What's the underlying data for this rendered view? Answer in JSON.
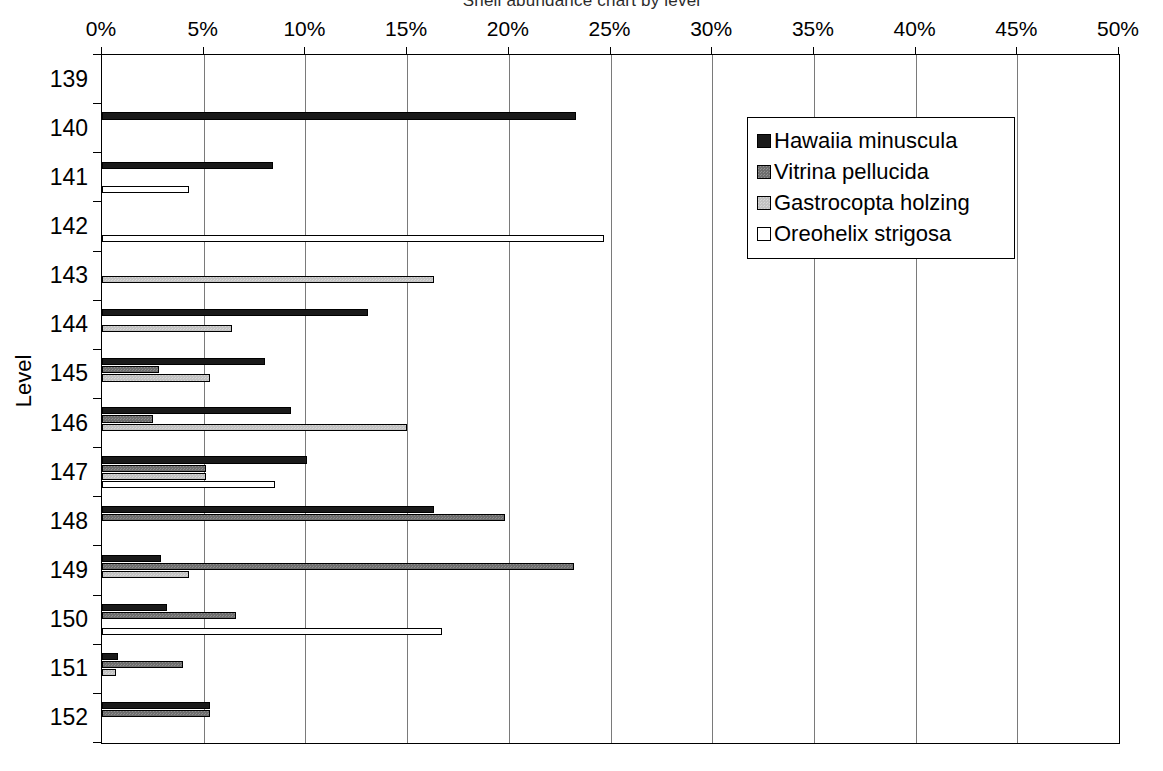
{
  "chart_data": {
    "type": "bar",
    "orientation": "horizontal",
    "title": "Shell abundance chart by level",
    "xlabel": "",
    "ylabel": "Level",
    "xlim": [
      0,
      50
    ],
    "xticks": [
      "0%",
      "5%",
      "10%",
      "15%",
      "20%",
      "25%",
      "30%",
      "35%",
      "40%",
      "45%",
      "50%"
    ],
    "xtick_values": [
      0,
      5,
      10,
      15,
      20,
      25,
      30,
      35,
      40,
      45,
      50
    ],
    "grid": true,
    "legend_position": "upper right",
    "categories": [
      "139",
      "140",
      "141",
      "142",
      "143",
      "144",
      "145",
      "146",
      "147",
      "148",
      "149",
      "150",
      "151",
      "152"
    ],
    "series": [
      {
        "name": "Hawaiia minuscula",
        "color": "#1a1a1a",
        "values": [
          0,
          23.3,
          8.4,
          0,
          0,
          13.1,
          8.0,
          9.3,
          10.1,
          16.3,
          2.9,
          3.2,
          0.8,
          5.3
        ]
      },
      {
        "name": "Vitrina pellucida",
        "color": "#6e6e6e",
        "values": [
          0,
          0,
          0,
          0,
          0,
          0,
          2.8,
          2.5,
          5.1,
          19.8,
          23.2,
          6.6,
          4.0,
          5.3
        ]
      },
      {
        "name": "Gastrocopta holzing",
        "color": "#c2c2c2",
        "values": [
          0,
          0,
          0,
          0,
          16.3,
          6.4,
          5.3,
          15.0,
          5.1,
          0,
          4.3,
          0,
          0.7,
          0
        ]
      },
      {
        "name": "Oreohelix strigosa",
        "color": "#ffffff",
        "values": [
          0,
          0,
          4.3,
          24.7,
          0,
          0,
          0,
          0,
          8.5,
          0,
          0,
          16.7,
          0,
          0
        ]
      }
    ]
  },
  "legend": {
    "entries": [
      {
        "label": "Hawaiia minuscula",
        "swatch": "black-square-icon"
      },
      {
        "label": "Vitrina pellucida",
        "swatch": "dark-gray-square-icon"
      },
      {
        "label": "Gastrocopta holzing",
        "swatch": "light-gray-square-icon"
      },
      {
        "label": "Oreohelix strigosa",
        "swatch": "white-square-icon"
      }
    ]
  },
  "axes": {
    "y_title": "Level"
  }
}
